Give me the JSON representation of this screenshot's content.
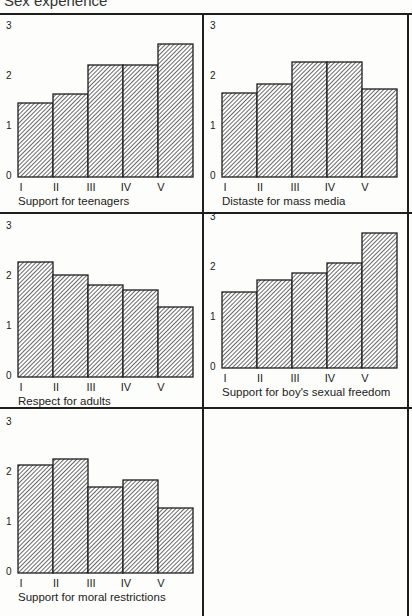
{
  "header": {
    "title": "Sex experience"
  },
  "chart_data": [
    {
      "type": "bar",
      "title": "Support for teenagers",
      "categories": [
        "I",
        "II",
        "III",
        "IV",
        "V"
      ],
      "values": [
        1.48,
        1.66,
        2.24,
        2.24,
        2.66
      ],
      "yticks": [
        "0",
        "1",
        "2",
        "3"
      ],
      "ylim": [
        0,
        3
      ],
      "xlabel": "",
      "ylabel": "",
      "grid": false,
      "hatched": true
    },
    {
      "type": "bar",
      "title": "Distaste for mass media",
      "categories": [
        "I",
        "II",
        "III",
        "IV",
        "V"
      ],
      "values": [
        1.68,
        1.86,
        2.3,
        2.3,
        1.76
      ],
      "yticks": [
        "0",
        "1",
        "2",
        "3"
      ],
      "ylim": [
        0,
        3
      ],
      "xlabel": "",
      "ylabel": "",
      "grid": false,
      "hatched": true
    },
    {
      "type": "bar",
      "title": "Respect for adults",
      "categories": [
        "I",
        "II",
        "III",
        "IV",
        "V"
      ],
      "values": [
        2.3,
        2.04,
        1.84,
        1.74,
        1.4
      ],
      "yticks": [
        "0",
        "1",
        "2",
        "3"
      ],
      "ylim": [
        0,
        3
      ],
      "xlabel": "",
      "ylabel": "",
      "grid": false,
      "hatched": true
    },
    {
      "type": "bar",
      "title": "Support for boy's sexual freedom",
      "categories": [
        "I",
        "II",
        "III",
        "IV",
        "V"
      ],
      "values": [
        1.52,
        1.76,
        1.9,
        2.1,
        2.7
      ],
      "yticks": [
        "0",
        "1",
        "2",
        "3"
      ],
      "ylim": [
        0,
        3
      ],
      "xlabel": "",
      "ylabel": "",
      "grid": false,
      "hatched": true
    },
    {
      "type": "bar",
      "title": "Support for moral restrictions",
      "categories": [
        "I",
        "II",
        "III",
        "IV",
        "V"
      ],
      "values": [
        2.16,
        2.28,
        1.72,
        1.86,
        1.3
      ],
      "yticks": [
        "0",
        "1",
        "2",
        "3"
      ],
      "ylim": [
        0,
        3
      ],
      "xlabel": "",
      "ylabel": "",
      "grid": false,
      "hatched": true
    }
  ],
  "colors": {
    "bar_fill": "#ffffff",
    "hatch": "#2a2a2a",
    "border": "#1e1e1e"
  }
}
